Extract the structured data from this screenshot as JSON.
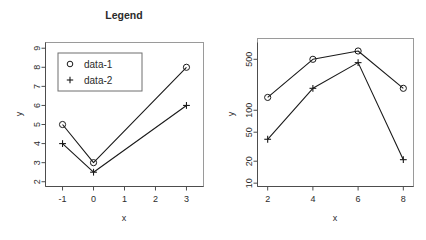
{
  "chart_data": [
    {
      "type": "line",
      "panel": "left",
      "title": "Legend",
      "xlabel": "x",
      "ylabel": "y",
      "xlim": [
        -1.55,
        3.55
      ],
      "ylim": [
        1.75,
        9.3
      ],
      "yscale": "linear",
      "grid": false,
      "xticks": [
        -1,
        0,
        1,
        2,
        3
      ],
      "xticklabels": [
        "-1",
        "0",
        "1",
        "2",
        "3"
      ],
      "yticks": [
        2,
        3,
        4,
        5,
        6,
        7,
        8,
        9
      ],
      "yticklabels": [
        "2",
        "3",
        "4",
        "5",
        "6",
        "7",
        "8",
        "9"
      ],
      "legend": {
        "position": "top-left-inside",
        "entries": [
          {
            "label": "data-1",
            "marker": "circle"
          },
          {
            "label": "data-2",
            "marker": "plus"
          }
        ]
      },
      "series": [
        {
          "name": "data-1",
          "marker": "circle",
          "x": [
            -1,
            0,
            3
          ],
          "values": [
            5,
            3,
            8
          ]
        },
        {
          "name": "data-2",
          "marker": "plus",
          "x": [
            -1,
            0,
            3
          ],
          "values": [
            4,
            2.5,
            6
          ]
        }
      ]
    },
    {
      "type": "line",
      "panel": "right",
      "title": "",
      "xlabel": "x",
      "ylabel": "y",
      "xlim": [
        1.55,
        8.45
      ],
      "ylim": [
        9,
        850
      ],
      "yscale": "log",
      "grid": false,
      "xticks": [
        2,
        4,
        6,
        8
      ],
      "xticklabels": [
        "2",
        "4",
        "6",
        "8"
      ],
      "yticks": [
        10,
        20,
        50,
        100,
        500
      ],
      "yticklabels": [
        "10",
        "20",
        "50",
        "100",
        "500"
      ],
      "legend": null,
      "series": [
        {
          "name": "data-1",
          "marker": "circle",
          "x": [
            2,
            4,
            6,
            8
          ],
          "values": [
            150,
            500,
            650,
            200
          ]
        },
        {
          "name": "data-2",
          "marker": "plus",
          "x": [
            2,
            4,
            6,
            8
          ],
          "values": [
            40,
            200,
            450,
            21
          ]
        }
      ]
    }
  ],
  "left_panel": {
    "title": "Legend",
    "xlabel": "x",
    "ylabel": "y",
    "xticklabels": [
      "-1",
      "0",
      "1",
      "2",
      "3"
    ],
    "yticklabels": [
      "2",
      "3",
      "4",
      "5",
      "6",
      "7",
      "8",
      "9"
    ],
    "legend_label_1": "data-1",
    "legend_label_2": "data-2"
  },
  "right_panel": {
    "xlabel": "x",
    "ylabel": "y",
    "xticklabels": [
      "2",
      "4",
      "6",
      "8"
    ],
    "yticklabels": [
      "10",
      "20",
      "50",
      "100",
      "500"
    ]
  },
  "colors": {
    "line": "#1a1a1a",
    "axis": "#4d4d4d",
    "frame": "#9a9a9a",
    "text": "#2b2b2b",
    "background": "#ffffff"
  }
}
